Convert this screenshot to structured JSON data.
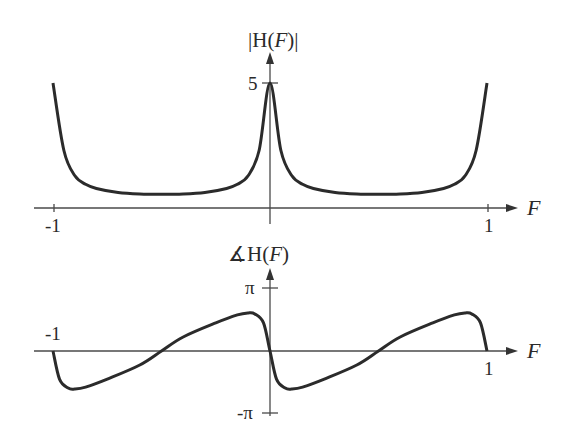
{
  "chart_data": [
    {
      "type": "line",
      "title": "|H(F)|",
      "xlabel": "F",
      "ylabel": "|H(F)|",
      "x_ticks": [
        "-1",
        "1"
      ],
      "y_ticks": [
        "5"
      ],
      "xlim": [
        -1,
        1
      ],
      "ylim": [
        0,
        5
      ],
      "grid": false,
      "legend": null,
      "series": [
        {
          "name": "magnitude",
          "x": [
            -1.0,
            -0.95,
            -0.9,
            -0.85,
            -0.8,
            -0.7,
            -0.6,
            -0.5,
            -0.4,
            -0.3,
            -0.2,
            -0.15,
            -0.1,
            -0.05,
            0.0,
            0.05,
            0.1,
            0.15,
            0.2,
            0.3,
            0.4,
            0.5,
            0.6,
            0.7,
            0.8,
            0.85,
            0.9,
            0.95,
            1.0
          ],
          "y": [
            5.0,
            2.3,
            1.3,
            0.95,
            0.78,
            0.62,
            0.56,
            0.55,
            0.56,
            0.62,
            0.78,
            0.95,
            1.3,
            2.3,
            5.0,
            2.3,
            1.3,
            0.95,
            0.78,
            0.62,
            0.56,
            0.55,
            0.56,
            0.62,
            0.78,
            0.95,
            1.3,
            2.3,
            5.0
          ]
        }
      ]
    },
    {
      "type": "line",
      "title": "∡H(F)",
      "xlabel": "F",
      "ylabel": "∡H(F)",
      "x_ticks": [
        "-1",
        "1"
      ],
      "y_ticks": [
        "π",
        "-π"
      ],
      "xlim": [
        -1,
        1
      ],
      "ylim": [
        -3.1416,
        3.1416
      ],
      "grid": false,
      "legend": null,
      "series": [
        {
          "name": "phase",
          "x": [
            -1.0,
            -0.97,
            -0.93,
            -0.9,
            -0.85,
            -0.75,
            -0.6,
            -0.5,
            -0.4,
            -0.25,
            -0.15,
            -0.1,
            -0.07,
            -0.03,
            0.0,
            0.03,
            0.07,
            0.1,
            0.15,
            0.25,
            0.4,
            0.5,
            0.6,
            0.75,
            0.85,
            0.9,
            0.93,
            0.97,
            1.0
          ],
          "y": [
            0.0,
            -1.4,
            -1.85,
            -1.9,
            -1.8,
            -1.4,
            -0.7,
            0.0,
            0.7,
            1.4,
            1.8,
            1.9,
            1.85,
            1.4,
            0.0,
            -1.4,
            -1.85,
            -1.9,
            -1.8,
            -1.4,
            -0.7,
            0.0,
            0.7,
            1.4,
            1.8,
            1.9,
            1.85,
            1.4,
            0.0
          ]
        }
      ]
    }
  ],
  "top_plot": {
    "title_bar": "|",
    "title_text": "H(",
    "title_var": "F",
    "title_close": ")",
    "title_bar_close": "|",
    "y_tick_5": "5",
    "x_tick_neg1": "-1",
    "x_tick_1": "1",
    "x_axis_var": "F"
  },
  "bottom_plot": {
    "title_angle": "∡",
    "title_text": "H(",
    "title_var": "F",
    "title_close": ")",
    "y_tick_pi": "π",
    "y_tick_neg_pi": "-π",
    "x_tick_neg1": "-1",
    "x_tick_1": "1",
    "x_axis_var": "F"
  },
  "colors": {
    "curve": "#2b2b2b",
    "axis": "#4a4a4a",
    "background": "#ffffff"
  }
}
